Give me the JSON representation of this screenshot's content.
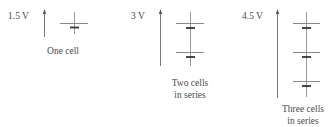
{
  "panels": [
    {
      "voltage": "1.5 V",
      "caption_line1": "One cell",
      "caption_line2": "",
      "cells": 1
    },
    {
      "voltage": "3 V",
      "caption_line1": "Two cells",
      "caption_line2": "in series",
      "cells": 2
    },
    {
      "voltage": "4.5 V",
      "caption_line1": "Three cells",
      "caption_line2": "in series",
      "cells": 3
    }
  ],
  "colors": {
    "line": "#8a8a8a",
    "plate_short": "#333333",
    "text": "#4a4a4a"
  }
}
